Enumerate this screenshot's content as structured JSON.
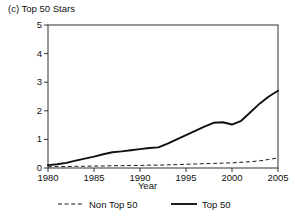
{
  "panel": {
    "title": "(c) Top 50 Stars"
  },
  "legend": {
    "entries": [
      {
        "label": "Non Top 50",
        "style": "dashed",
        "color": "#1a1a1a"
      },
      {
        "label": "Top 50",
        "style": "solid",
        "color": "#111111"
      }
    ]
  },
  "axes": {
    "x_label": "Year",
    "x_ticks": [
      "1980",
      "1985",
      "1990",
      "1995",
      "2000",
      "2005"
    ],
    "y_ticks": [
      "0",
      "1",
      "2",
      "3",
      "4",
      "5"
    ]
  },
  "chart_data": {
    "type": "line",
    "title": "(c) Top 50 Stars",
    "xlabel": "Year",
    "ylabel": "",
    "xlim": [
      1980,
      2005
    ],
    "ylim": [
      0,
      5
    ],
    "grid": false,
    "legend_position": "bottom",
    "x": [
      1980,
      1981,
      1982,
      1983,
      1984,
      1985,
      1986,
      1987,
      1988,
      1989,
      1990,
      1991,
      1992,
      1993,
      1994,
      1995,
      1996,
      1997,
      1998,
      1999,
      2000,
      2001,
      2002,
      2003,
      2004,
      2005
    ],
    "series": [
      {
        "name": "Top 50",
        "style": "solid",
        "color": "#111111",
        "values": [
          0.1,
          0.13,
          0.18,
          0.26,
          0.33,
          0.4,
          0.48,
          0.55,
          0.58,
          0.62,
          0.66,
          0.7,
          0.72,
          0.85,
          1.0,
          1.15,
          1.3,
          1.45,
          1.58,
          1.6,
          1.52,
          1.65,
          1.95,
          2.25,
          2.5,
          2.7
        ]
      },
      {
        "name": "Non Top 50",
        "style": "dashed",
        "color": "#1a1a1a",
        "values": [
          0.04,
          0.05,
          0.05,
          0.06,
          0.06,
          0.07,
          0.07,
          0.08,
          0.08,
          0.09,
          0.09,
          0.1,
          0.1,
          0.11,
          0.12,
          0.13,
          0.14,
          0.15,
          0.16,
          0.17,
          0.18,
          0.2,
          0.22,
          0.25,
          0.3,
          0.35
        ]
      }
    ]
  }
}
